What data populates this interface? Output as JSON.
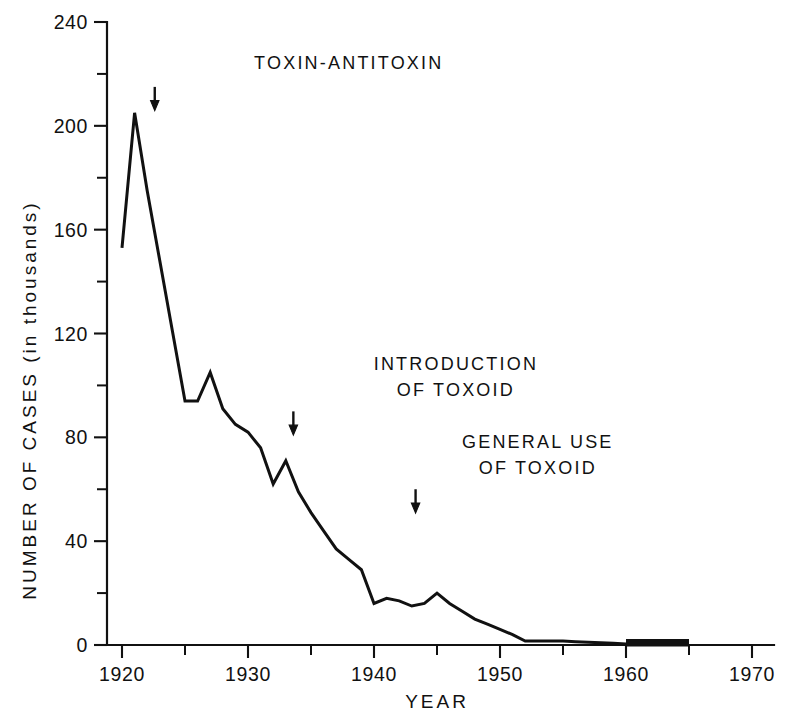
{
  "chart_data": {
    "type": "line",
    "title": "",
    "subtitle": "",
    "xlabel": "YEAR",
    "ylabel": "NUMBER OF CASES (in thousands)",
    "xlim": [
      1918,
      1970
    ],
    "ylim": [
      0,
      240
    ],
    "grid": false,
    "legend": "none",
    "x_ticks_major": [
      1920,
      1930,
      1940,
      1950,
      1960,
      1970
    ],
    "x_tick_labels": [
      "1920",
      "1930",
      "1940",
      "1950",
      "1960",
      "1970"
    ],
    "x_ticks_minor": [
      1925,
      1935,
      1945,
      1955,
      1965
    ],
    "y_ticks_major": [
      0,
      40,
      80,
      120,
      160,
      200,
      240
    ],
    "y_tick_labels": [
      "0",
      "40",
      "80",
      "120",
      "160",
      "200",
      "240"
    ],
    "y_ticks_minor": [
      20,
      60,
      100,
      140,
      180,
      220
    ],
    "series": [
      {
        "name": "Diphtheria cases",
        "x": [
          1920,
          1921,
          1922,
          1923,
          1924,
          1925,
          1926,
          1927,
          1928,
          1929,
          1930,
          1931,
          1932,
          1933,
          1934,
          1935,
          1936,
          1937,
          1938,
          1939,
          1940,
          1941,
          1942,
          1943,
          1944,
          1945,
          1946,
          1947,
          1948,
          1949,
          1950,
          1951,
          1952,
          1953,
          1954,
          1955,
          1956,
          1957,
          1958,
          1959,
          1960,
          1961,
          1962,
          1963,
          1964,
          1965
        ],
        "values": [
          153,
          205,
          175,
          148,
          121,
          94,
          94,
          105,
          91,
          85,
          82,
          76,
          62,
          71,
          59,
          51,
          44,
          37,
          33,
          29,
          16,
          18,
          17,
          15,
          16,
          20,
          16,
          13,
          10,
          8,
          6,
          4,
          1.5,
          1.5,
          1.5,
          1.5,
          1.3,
          1.1,
          0.9,
          0.7,
          0.4,
          0.3,
          0.3,
          0.3,
          0.3,
          0.3
        ]
      }
    ],
    "annotations": [
      {
        "id": "toxin-antitoxin",
        "lines": [
          "TOXIN-ANTITOXIN"
        ],
        "text_x": 1938,
        "arrow_x": 1922.6,
        "text_y": 222,
        "arrow_y_top": 215,
        "arrow_y_bottom": 207
      },
      {
        "id": "introduction-of-toxoid",
        "lines": [
          "INTRODUCTION",
          "OF TOXOID"
        ],
        "text_x": 1946.5,
        "arrow_x": 1933.6,
        "text_y": 106,
        "arrow_y_top": 90,
        "arrow_y_bottom": 82
      },
      {
        "id": "general-use-of-toxoid",
        "lines": [
          "GENERAL USE",
          "OF TOXOID"
        ],
        "text_x": 1953,
        "arrow_x": 1943.3,
        "text_y": 76,
        "arrow_y_top": 60,
        "arrow_y_bottom": 52
      }
    ],
    "colors": {
      "line": "#111111",
      "axis": "#111111",
      "background": "#ffffff"
    }
  }
}
